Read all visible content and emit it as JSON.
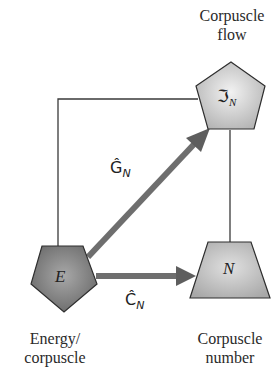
{
  "diagram": {
    "nodes": {
      "energy": {
        "symbol": "E",
        "label_line1": "Energy/",
        "label_line2": "corpuscle",
        "shape": "pentagon",
        "fill": "#7a7a7a"
      },
      "flow": {
        "symbol": "ℑ",
        "subscript": "N",
        "label_line1": "Corpuscle",
        "label_line2": "flow",
        "shape": "pentagon",
        "fill": "#cfcfcf"
      },
      "number": {
        "symbol": "N",
        "label_line1": "Corpuscle",
        "label_line2": "number",
        "shape": "trapezoid",
        "fill": "#bdbdbd"
      }
    },
    "edges": {
      "g": {
        "from": "energy",
        "to": "flow",
        "operator": "Ĝ",
        "subscript": "N",
        "style": "thick-arrow"
      },
      "c": {
        "from": "energy",
        "to": "number",
        "operator": "Ĉ",
        "subscript": "N",
        "style": "thick-arrow"
      },
      "box_left": {
        "from": "energy",
        "to": "flow",
        "style": "thin-line"
      },
      "box_right": {
        "from": "flow",
        "to": "number",
        "style": "thin-line"
      }
    },
    "colors": {
      "arrow": "#6e6e6e",
      "line": "#3a3a3a",
      "outline": "#2e2e2e"
    }
  }
}
